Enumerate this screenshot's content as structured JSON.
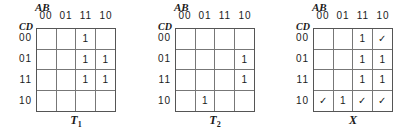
{
  "axis_labels": {
    "columns_var": "AB",
    "rows_var": "CD"
  },
  "column_headers": [
    "00",
    "01",
    "11",
    "10"
  ],
  "row_headers": [
    "00",
    "01",
    "11",
    "10"
  ],
  "legend": {
    "one": "1",
    "check": "✓"
  },
  "maps": [
    {
      "name": "T1",
      "caption_main": "T",
      "caption_sub": "1",
      "cells": [
        [
          "",
          "",
          "1",
          ""
        ],
        [
          "",
          "",
          "1",
          "1"
        ],
        [
          "",
          "",
          "1",
          "1"
        ],
        [
          "",
          "",
          "",
          ""
        ]
      ]
    },
    {
      "name": "T2",
      "caption_main": "T",
      "caption_sub": "2",
      "cells": [
        [
          "",
          "",
          "",
          ""
        ],
        [
          "",
          "",
          "",
          "1"
        ],
        [
          "",
          "",
          "",
          "1"
        ],
        [
          "",
          "1",
          "",
          ""
        ]
      ]
    },
    {
      "name": "X",
      "caption_main": "X",
      "caption_sub": "",
      "cells": [
        [
          "",
          "",
          "1",
          "✓"
        ],
        [
          "",
          "",
          "1",
          "1"
        ],
        [
          "",
          "",
          "1",
          "1"
        ],
        [
          "✓",
          "1",
          "✓",
          "✓"
        ]
      ]
    }
  ]
}
